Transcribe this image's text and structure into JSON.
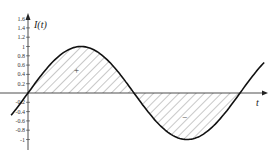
{
  "chart_data": {
    "type": "line",
    "title": "",
    "xlabel": "t",
    "ylabel": "I(t)",
    "yticks": [
      "1.6",
      "1.4",
      "1.2",
      "1",
      "0.8",
      "0.6",
      "0.4",
      "0.2",
      "-0.2",
      "-0.4",
      "-0.6",
      "-0.8",
      "-1"
    ],
    "ylim": [
      -1,
      1.6
    ],
    "series": [
      {
        "name": "I(t)",
        "function": "sin(t)",
        "t_range": [
          -0.5,
          7.0
        ]
      }
    ],
    "annotations": [
      {
        "text": "+",
        "region": "positive area"
      },
      {
        "text": "−",
        "region": "negative area"
      }
    ],
    "shading": "hatched area between curve and t-axis over one period",
    "grid": false
  },
  "labels": {
    "yaxis": "I(t)",
    "xaxis": "t",
    "plus": "+",
    "minus": "−"
  }
}
